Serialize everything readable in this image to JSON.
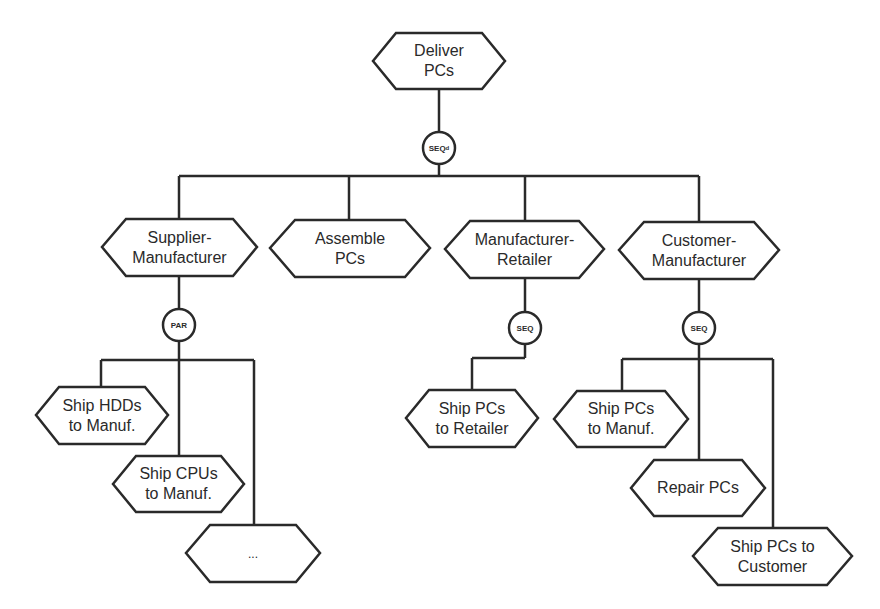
{
  "colors": {
    "stroke": "#2a2a2a",
    "fill": "#ffffff",
    "text": "#2a2a2a"
  },
  "root": {
    "line1": "Deliver",
    "line2": "PCs"
  },
  "root_op": {
    "label": "SEQ",
    "sub": "d"
  },
  "level1": [
    {
      "line1": "Supplier-",
      "line2": "Manufacturer"
    },
    {
      "line1": "Assemble",
      "line2": "PCs"
    },
    {
      "line1": "Manufacturer-",
      "line2": "Retailer"
    },
    {
      "line1": "Customer-",
      "line2": "Manufacturer"
    }
  ],
  "ops": {
    "supplier": "PAR",
    "retailer": "SEQ",
    "customer": "SEQ"
  },
  "supplier_children": [
    {
      "line1": "Ship HDDs",
      "line2": "to Manuf."
    },
    {
      "line1": "Ship CPUs",
      "line2": "to Manuf."
    },
    {
      "line1": "...",
      "line2": ""
    }
  ],
  "retailer_children": [
    {
      "line1": "Ship PCs",
      "line2": "to Retailer"
    }
  ],
  "customer_children": [
    {
      "line1": "Ship PCs",
      "line2": "to Manuf."
    },
    {
      "line1": "Repair PCs",
      "line2": ""
    },
    {
      "line1": "Ship PCs to",
      "line2": "Customer"
    }
  ]
}
